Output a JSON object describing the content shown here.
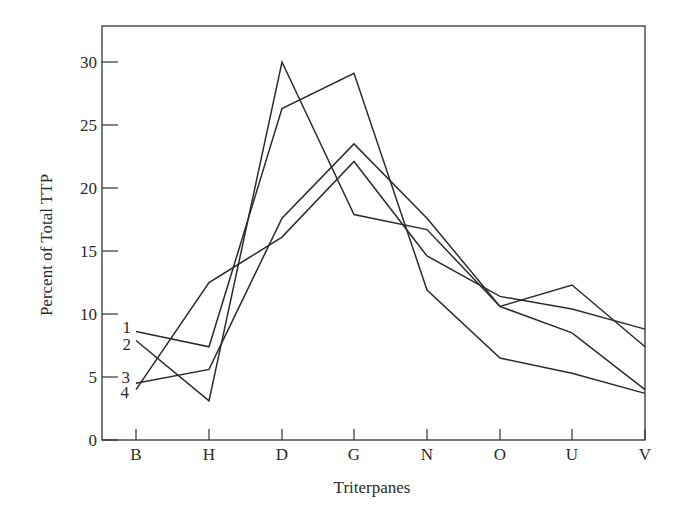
{
  "chart_data": {
    "type": "line",
    "title": "",
    "xlabel": "Triterpanes",
    "ylabel": "Percent of Total TTP",
    "categories": [
      "B",
      "H",
      "D",
      "G",
      "N",
      "O",
      "U",
      "V"
    ],
    "yticks": [
      0,
      5,
      10,
      15,
      20,
      25,
      30
    ],
    "ylim": [
      0,
      33
    ],
    "grid": false,
    "legend": "inline labels at left of lines (1, 2, 3, 4)",
    "series": [
      {
        "name": "1",
        "values": [
          8.6,
          7.4,
          26.3,
          29.1,
          11.9,
          6.5,
          5.3,
          3.7
        ]
      },
      {
        "name": "2",
        "values": [
          7.9,
          3.1,
          30.0,
          17.9,
          16.7,
          10.6,
          12.3,
          7.4
        ]
      },
      {
        "name": "3",
        "values": [
          4.5,
          5.6,
          17.6,
          23.5,
          17.6,
          10.6,
          8.5,
          4.0
        ]
      },
      {
        "name": "4",
        "values": [
          4.0,
          12.5,
          16.1,
          22.1,
          14.6,
          11.4,
          10.4,
          8.8
        ]
      }
    ]
  },
  "layout": {
    "plot_left": 102,
    "plot_right": 645,
    "plot_top": 26,
    "plot_bottom": 440,
    "x_positions": [
      136,
      209,
      282,
      354,
      427,
      500,
      572,
      645
    ],
    "px_per_unit": 12.6
  },
  "labels": {
    "xlabel": "Triterpanes",
    "ylabel": "Percent of Total TTP"
  }
}
